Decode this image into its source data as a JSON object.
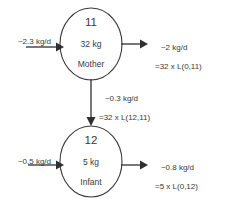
{
  "diagram": {
    "type": "compartmental-flow-model",
    "background_color": "#ffffff",
    "line_color": "#2f2f2f",
    "text_color": "#3a3a3a",
    "nodes": [
      {
        "id": "11",
        "mass": "32 kg",
        "name": "Mother"
      },
      {
        "id": "12",
        "mass": "5 kg",
        "name": "Infant"
      }
    ],
    "flows": {
      "mother_input": {
        "line1": "~2.3 kg/d",
        "line2": ""
      },
      "mother_output": {
        "line1": "~2 kg/d",
        "line2": "=32 x L(0,11)"
      },
      "mother_to_infant": {
        "line1": "~0.3 kg/d",
        "line2": "=32 x L(12,11)"
      },
      "infant_input": {
        "line1": "~0.5 kg/d",
        "line2": ""
      },
      "infant_output": {
        "line1": "~0.8 kg/d",
        "line2": "=5 x L(0,12)"
      }
    }
  }
}
